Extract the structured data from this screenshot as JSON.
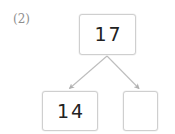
{
  "worksheet": {
    "problem_number": "(2)",
    "type": "number-bond",
    "total": {
      "label": "17",
      "filled": true
    },
    "parts": [
      {
        "label": "14",
        "filled": true
      },
      {
        "label": "",
        "filled": false
      }
    ],
    "arrows": [
      {
        "name": "arrow-to-left-part",
        "from": [
          107,
          56
        ],
        "to": [
          68,
          90
        ],
        "head": "down-left"
      },
      {
        "name": "arrow-to-right-part",
        "from": [
          107,
          56
        ],
        "to": [
          140,
          90
        ],
        "head": "down-right"
      }
    ],
    "colors": {
      "background": "#ffffff",
      "box_border": "#cfcfcf",
      "digit": "#222222",
      "label": "#8e8e8e",
      "arrow": "#b4b4b4"
    }
  }
}
